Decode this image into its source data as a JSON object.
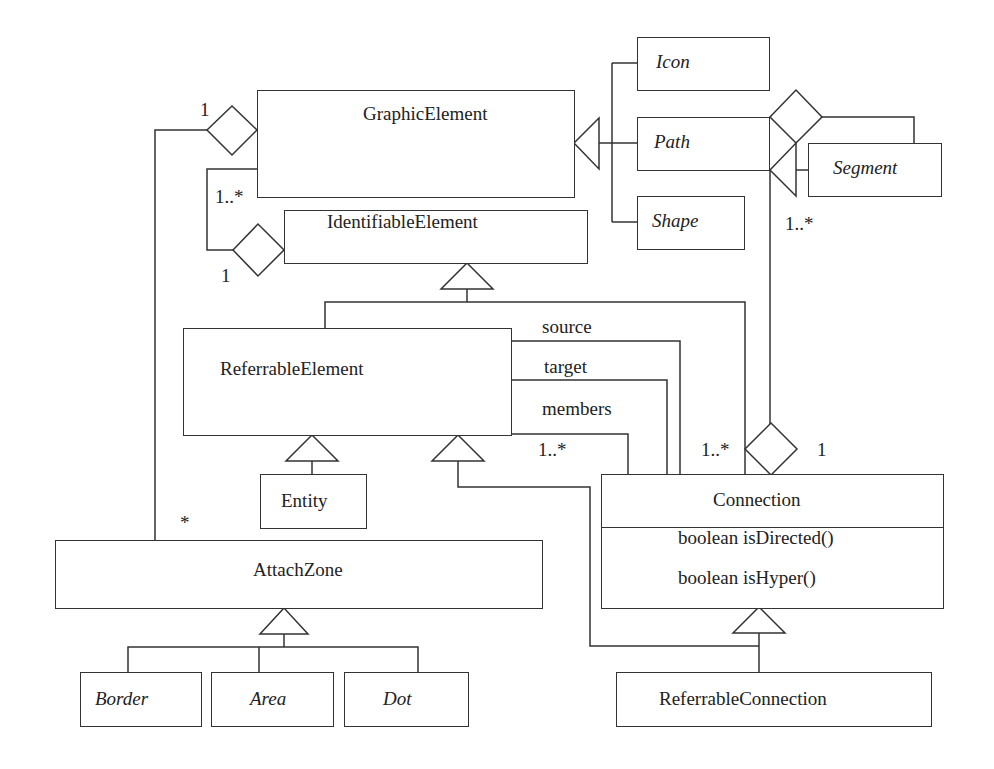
{
  "diagram": {
    "type": "uml-class-diagram",
    "classes": {
      "graphic_element": "GraphicElement",
      "identifiable_element": "IdentifiableElement",
      "icon": "Icon",
      "path": "Path",
      "shape": "Shape",
      "segment": "Segment",
      "referrable_element": "ReferrableElement",
      "entity": "Entity",
      "connection": "Connection",
      "attach_zone": "AttachZone",
      "border": "Border",
      "area": "Area",
      "dot": "Dot",
      "referrable_connection": "ReferrableConnection"
    },
    "connection_methods": [
      "boolean isDirected()",
      "boolean isHyper()"
    ],
    "roles": {
      "source": "source",
      "target": "target",
      "members": "members"
    },
    "multiplicities": {
      "graphic_attach_one": "1",
      "graphic_self_many": "1..*",
      "identifiable_one": "1",
      "segment_many": "1..*",
      "members_many": "1..*",
      "connection_path_many": "1..*",
      "connection_path_one": "1",
      "attachzone_many": "*"
    }
  }
}
